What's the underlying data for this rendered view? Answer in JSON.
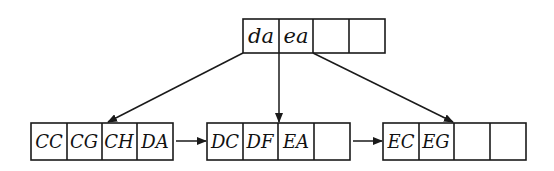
{
  "diagram": {
    "type": "B+ tree",
    "colors": {
      "stroke": "#1a1a1a",
      "background": "#ffffff",
      "text": "#111111"
    },
    "root": {
      "keys": [
        "da",
        "ea",
        "",
        ""
      ]
    },
    "leaves": [
      {
        "keys": [
          "CC",
          "CG",
          "CH",
          "DA"
        ]
      },
      {
        "keys": [
          "DC",
          "DF",
          "EA",
          ""
        ]
      },
      {
        "keys": [
          "EC",
          "EG",
          "",
          ""
        ]
      }
    ],
    "edges": [
      {
        "from": "root.pointer0",
        "to": "leaves.0"
      },
      {
        "from": "root.pointer1",
        "to": "leaves.1"
      },
      {
        "from": "root.pointer2",
        "to": "leaves.2"
      },
      {
        "from": "leaves.0",
        "to": "leaves.1",
        "kind": "sibling-link"
      },
      {
        "from": "leaves.1",
        "to": "leaves.2",
        "kind": "sibling-link"
      }
    ]
  }
}
